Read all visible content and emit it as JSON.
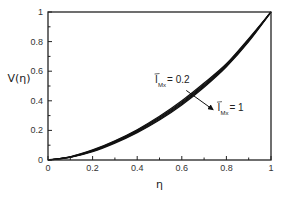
{
  "chart_data": {
    "type": "line",
    "title": "",
    "xlabel": "η",
    "ylabel": "V(η)",
    "xlim": [
      0,
      1
    ],
    "ylim": [
      0,
      1
    ],
    "grid": false,
    "legend": "none",
    "x_ticks": [
      0,
      0.2,
      0.4,
      0.6,
      0.8,
      1
    ],
    "x_tick_labels": [
      "0",
      "0.2",
      "0.4",
      "0.6",
      "0.8",
      "1"
    ],
    "x_minor_ticks": [
      0.1,
      0.3,
      0.5,
      0.7,
      0.9
    ],
    "y_ticks": [
      0,
      0.2,
      0.4,
      0.6,
      0.8,
      1
    ],
    "y_tick_labels": [
      "0",
      "0.2",
      "0.4",
      "0.6",
      "0.8",
      "1"
    ],
    "y_minor_ticks": [
      0.1,
      0.3,
      0.5,
      0.7,
      0.9
    ],
    "x": [
      0,
      0.1,
      0.2,
      0.3,
      0.4,
      0.5,
      0.6,
      0.7,
      0.8,
      0.9,
      1.0
    ],
    "series": [
      {
        "name": "I_Mx = 0.2",
        "values": [
          0,
          0.022,
          0.068,
          0.13,
          0.205,
          0.295,
          0.4,
          0.52,
          0.65,
          0.82,
          1.0
        ]
      },
      {
        "name": "I_Mx = 0.4",
        "values": [
          0,
          0.021,
          0.065,
          0.126,
          0.2,
          0.288,
          0.392,
          0.512,
          0.645,
          0.815,
          1.0
        ]
      },
      {
        "name": "I_Mx = 0.6",
        "values": [
          0,
          0.02,
          0.062,
          0.122,
          0.195,
          0.282,
          0.385,
          0.505,
          0.64,
          0.81,
          1.0
        ]
      },
      {
        "name": "I_Mx = 0.8",
        "values": [
          0,
          0.019,
          0.059,
          0.118,
          0.19,
          0.276,
          0.378,
          0.498,
          0.635,
          0.805,
          1.0
        ]
      },
      {
        "name": "I_Mx = 1",
        "values": [
          0,
          0.018,
          0.056,
          0.114,
          0.185,
          0.27,
          0.372,
          0.492,
          0.63,
          0.8,
          1.0
        ]
      }
    ],
    "annotations": [
      {
        "text_main": "I",
        "text_sub": "Mx",
        "text_rest": " = 0.2",
        "role": "arrow-start"
      },
      {
        "text_main": "I",
        "text_sub": "Mx",
        "text_rest": " = 1",
        "role": "arrow-end"
      }
    ],
    "arrow": {
      "from": [
        0.62,
        0.47
      ],
      "to": [
        0.74,
        0.34
      ]
    },
    "annotation_positions": [
      [
        0.48,
        0.52
      ],
      [
        0.76,
        0.33
      ]
    ],
    "line_color": "#111111"
  }
}
